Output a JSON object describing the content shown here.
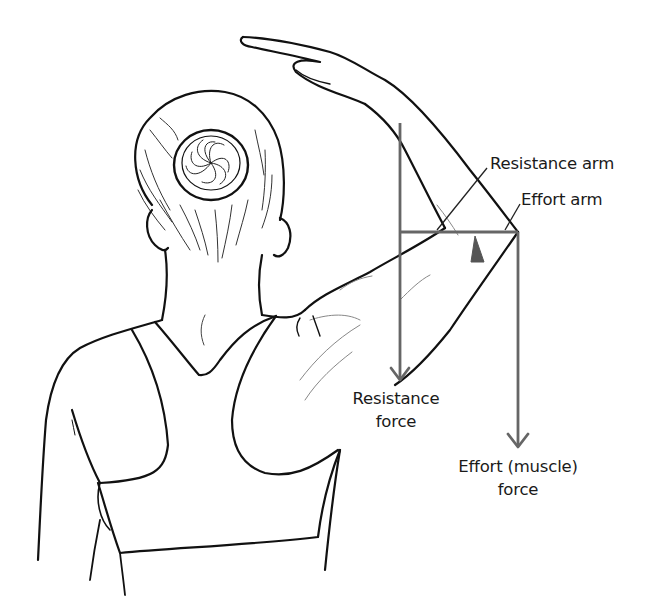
{
  "diagram": {
    "colors": {
      "line_art": "#111111",
      "force_lines": "#666666",
      "fulcrum": "#555555",
      "background": "#ffffff",
      "text": "#1a1a1a"
    },
    "labels": {
      "resistance_arm": "Resistance arm",
      "effort_arm": "Effort arm",
      "resistance_force_line1": "Resistance",
      "resistance_force_line2": "force",
      "effort_force_line1": "Effort (muscle)",
      "effort_force_line2": "force"
    },
    "elements": [
      {
        "name": "resistance-force-arrow",
        "direction": "down"
      },
      {
        "name": "effort-force-arrow",
        "direction": "down"
      },
      {
        "name": "lever-arm-line",
        "orientation": "horizontal"
      },
      {
        "name": "fulcrum-triangle",
        "shape": "triangle"
      }
    ]
  }
}
